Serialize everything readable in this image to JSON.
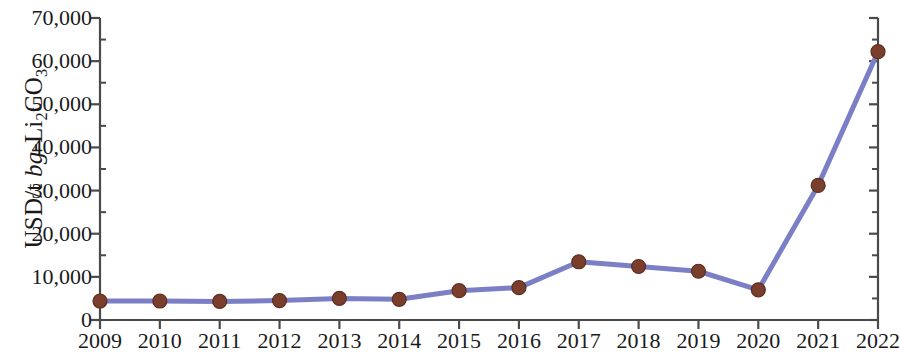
{
  "chart_data": {
    "type": "line",
    "title": "",
    "subtitle": "",
    "xlabel": "",
    "ylabel": "USD/t bg-Li2CO3",
    "ylabel_parts": {
      "prefix": "USD/t ",
      "italic": "bg",
      "dash": "-Li",
      "sub1": "2",
      "mid": "CO",
      "sub2": "3"
    },
    "categories": [
      "2009",
      "2010",
      "2011",
      "2012",
      "2013",
      "2014",
      "2015",
      "2016",
      "2017",
      "2018",
      "2019",
      "2020",
      "2021",
      "2022"
    ],
    "x": [
      2009,
      2010,
      2011,
      2012,
      2013,
      2014,
      2015,
      2016,
      2017,
      2018,
      2019,
      2020,
      2021,
      2022
    ],
    "values": [
      4400,
      4400,
      4300,
      4500,
      5000,
      4800,
      6800,
      7500,
      13500,
      12400,
      11300,
      7000,
      31200,
      62200
    ],
    "series": [
      {
        "name": "Battery grade lithium carbonate price",
        "values": [
          4400,
          4400,
          4300,
          4500,
          5000,
          4800,
          6800,
          7500,
          13500,
          12400,
          11300,
          7000,
          31200,
          62200
        ]
      }
    ],
    "ylim": [
      0,
      70000
    ],
    "xlim": [
      2009,
      2022
    ],
    "ytick_values": [
      0,
      10000,
      20000,
      30000,
      40000,
      50000,
      60000,
      70000
    ],
    "ytick_labels": [
      "0",
      "10,000",
      "20,000",
      "30,000",
      "40,000",
      "50,000",
      "60,000",
      "70,000"
    ],
    "yminor_step": 5000,
    "xtick_labels": [
      "2009",
      "2010",
      "2011",
      "2012",
      "2013",
      "2014",
      "2015",
      "2016",
      "2017",
      "2018",
      "2019",
      "2020",
      "2021",
      "2022"
    ],
    "grid": false,
    "legend": null,
    "legend_position": "none",
    "annotations": [],
    "colors": {
      "line": "#7b80c6",
      "marker_fill": "#7a3e2c",
      "marker_edge": "#5e2d1f",
      "axis": "#4a4a4a",
      "text": "#1a1a1a",
      "background": "#ffffff"
    },
    "line_width": 5,
    "marker_radius": 7
  }
}
